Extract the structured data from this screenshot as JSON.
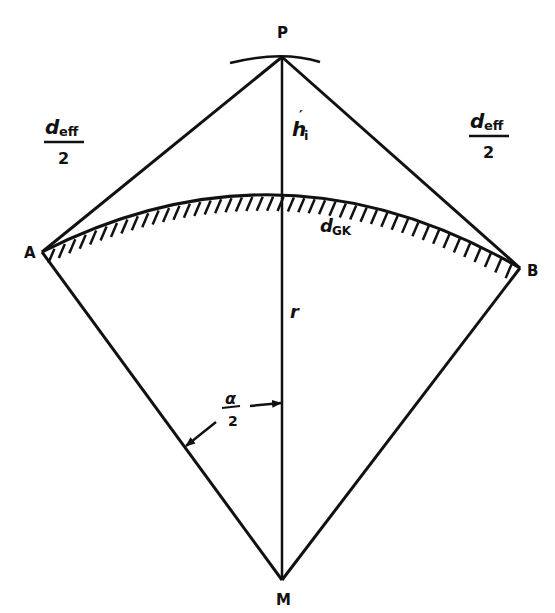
{
  "diagram": {
    "points": {
      "P": {
        "label": "P",
        "x": 282,
        "y": 57
      },
      "A": {
        "label": "A",
        "x": 42,
        "y": 252
      },
      "B": {
        "label": "B",
        "x": 520,
        "y": 268
      },
      "M": {
        "label": "M",
        "x": 282,
        "y": 580
      }
    },
    "labels": {
      "deff_left": {
        "main": "d",
        "sub": "eff",
        "denominator": "2"
      },
      "deff_right": {
        "main": "d",
        "sub": "eff",
        "denominator": "2"
      },
      "height": {
        "main": "h",
        "prime": "′",
        "sub": "i"
      },
      "radius": "r",
      "dGK": {
        "main": "d",
        "sub": "GK"
      },
      "angle": {
        "numerator": "α",
        "denominator": "2"
      }
    },
    "colors": {
      "stroke": "#111111",
      "background": "#ffffff"
    }
  }
}
